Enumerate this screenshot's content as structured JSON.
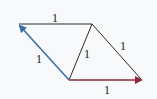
{
  "diagram": {
    "colors": {
      "background": "#f7f9fb",
      "edge": "#2a2a2a",
      "blue_vector": "#3a6fa8",
      "red_vector": "#8a2a3a"
    },
    "vertices": {
      "top_left": [
        18,
        24
      ],
      "top_right": [
        92,
        24
      ],
      "bottom_left": [
        69,
        80
      ],
      "bottom_right": [
        143,
        80
      ]
    },
    "edges": [
      {
        "id": "top",
        "from": "top_right",
        "to": "top_left",
        "label": "1",
        "style": "plain"
      },
      {
        "id": "left",
        "from": "bottom_left",
        "to": "top_left",
        "label": "1",
        "style": "blue-arrow"
      },
      {
        "id": "diagonal",
        "from": "bottom_left",
        "to": "top_right",
        "label": "1",
        "style": "plain"
      },
      {
        "id": "right",
        "from": "top_right",
        "to": "bottom_right",
        "label": "1",
        "style": "plain"
      },
      {
        "id": "bottom",
        "from": "bottom_left",
        "to": "bottom_right",
        "label": "1",
        "style": "red-arrow"
      }
    ],
    "labels": {
      "top": "1",
      "left": "1",
      "diagonal": "1",
      "right": "1",
      "bottom": "1"
    }
  }
}
